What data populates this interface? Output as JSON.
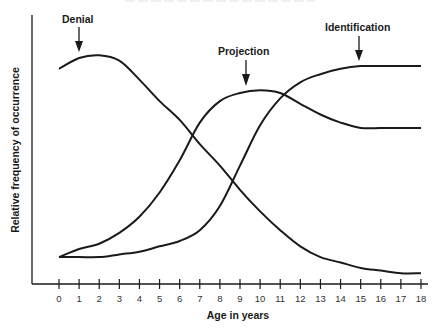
{
  "chart_data": {
    "type": "line",
    "title": "",
    "xlabel": "Age in years",
    "ylabel": "Relative frequency of occurrence",
    "x": [
      0,
      1,
      2,
      3,
      4,
      5,
      6,
      7,
      8,
      9,
      10,
      11,
      12,
      13,
      14,
      15,
      16,
      17,
      18
    ],
    "xlim": [
      0,
      18
    ],
    "ylim": [
      0,
      100
    ],
    "grid": false,
    "legend": "none (curves labeled directly with arrows)",
    "series": [
      {
        "name": "Denial",
        "annotation": {
          "label": "Denial",
          "arrow_x": 1
        },
        "values": [
          80,
          84,
          85,
          83,
          76,
          68,
          61,
          52,
          44,
          35,
          27,
          20,
          14,
          10,
          8,
          6,
          5,
          4,
          4
        ]
      },
      {
        "name": "Projection",
        "annotation": {
          "label": "Projection",
          "arrow_x": 9.5
        },
        "values": [
          10,
          13,
          15,
          19,
          25,
          34,
          46,
          60,
          68,
          71,
          72,
          71,
          67,
          63,
          60,
          58,
          58,
          58,
          58
        ]
      },
      {
        "name": "Identification",
        "annotation": {
          "label": "Identification",
          "arrow_x": 14.8
        },
        "values": [
          10,
          10,
          10,
          11,
          12,
          14,
          16,
          20,
          29,
          44,
          59,
          69,
          75,
          78,
          80,
          81,
          81,
          81,
          81
        ]
      }
    ]
  },
  "labels": {
    "denial": "Denial",
    "projection": "Projection",
    "identification": "Identification",
    "xlabel": "Age in years",
    "ylabel": "Relative frequency of occurrence"
  },
  "ticks": [
    "0",
    "1",
    "2",
    "3",
    "4",
    "5",
    "6",
    "7",
    "8",
    "9",
    "10",
    "11",
    "12",
    "13",
    "14",
    "15",
    "16",
    "17",
    "18"
  ],
  "colors": {
    "ink": "#1a1a1a",
    "background": "#ffffff"
  }
}
